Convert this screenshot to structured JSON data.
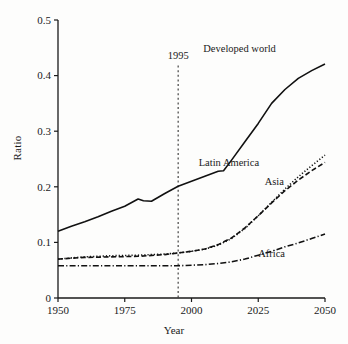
{
  "chart_data": {
    "type": "line",
    "title": "",
    "xlabel": "Year",
    "ylabel": "Ratio",
    "xlim": [
      1950,
      2050
    ],
    "ylim": [
      0,
      0.5
    ],
    "xticks": [
      1950,
      1975,
      2000,
      2025,
      2050
    ],
    "xticklabels": [
      "1950",
      "1975",
      "2000",
      "2025",
      "2050"
    ],
    "yticks": [
      0,
      0.1,
      0.2,
      0.3,
      0.4,
      0.5
    ],
    "yticklabels": [
      "0",
      "0.1",
      "0.2",
      "0.3",
      "0.4",
      "0.5"
    ],
    "grid": false,
    "legend_position": "inline-annotations",
    "annotations": [
      {
        "text": "1995",
        "type": "vertical-line",
        "x": 1995,
        "label_y": 0.43,
        "linestyle": "dotted"
      }
    ],
    "series": [
      {
        "name": "Developed world",
        "linestyle": "solid",
        "color": "#111111",
        "label_x": 2018,
        "label_y": 0.443,
        "x": [
          1950,
          1955,
          1960,
          1965,
          1970,
          1975,
          1980,
          1982,
          1985,
          1990,
          1995,
          2000,
          2005,
          2010,
          2012,
          2015,
          2020,
          2025,
          2030,
          2035,
          2040,
          2045,
          2050
        ],
        "y": [
          0.12,
          0.129,
          0.137,
          0.146,
          0.156,
          0.165,
          0.178,
          0.175,
          0.174,
          0.188,
          0.201,
          0.21,
          0.219,
          0.228,
          0.229,
          0.248,
          0.281,
          0.314,
          0.35,
          0.375,
          0.395,
          0.409,
          0.421
        ]
      },
      {
        "name": "Latin America",
        "linestyle": "dotted",
        "color": "#111111",
        "label_x": 2014,
        "label_y": 0.238,
        "x": [
          1950,
          1960,
          1970,
          1980,
          1990,
          1995,
          2000,
          2005,
          2010,
          2015,
          2020,
          2025,
          2030,
          2035,
          2040,
          2045,
          2050
        ],
        "y": [
          0.07,
          0.074,
          0.076,
          0.077,
          0.079,
          0.081,
          0.084,
          0.088,
          0.095,
          0.107,
          0.125,
          0.148,
          0.172,
          0.196,
          0.218,
          0.238,
          0.257
        ]
      },
      {
        "name": "Asia",
        "linestyle": "dashed",
        "color": "#111111",
        "label_x": 2031,
        "label_y": 0.204,
        "x": [
          1950,
          1960,
          1970,
          1980,
          1990,
          1995,
          2000,
          2005,
          2010,
          2015,
          2020,
          2025,
          2030,
          2035,
          2040,
          2045,
          2050
        ],
        "y": [
          0.07,
          0.073,
          0.074,
          0.075,
          0.078,
          0.081,
          0.084,
          0.088,
          0.096,
          0.108,
          0.126,
          0.148,
          0.171,
          0.193,
          0.212,
          0.229,
          0.244
        ]
      },
      {
        "name": "Africa",
        "linestyle": "dashdot",
        "color": "#111111",
        "label_x": 2030,
        "label_y": 0.073,
        "x": [
          1950,
          1960,
          1970,
          1980,
          1990,
          1995,
          2000,
          2005,
          2010,
          2015,
          2020,
          2025,
          2030,
          2035,
          2040,
          2045,
          2050
        ],
        "y": [
          0.058,
          0.058,
          0.058,
          0.058,
          0.058,
          0.058,
          0.059,
          0.06,
          0.062,
          0.065,
          0.07,
          0.077,
          0.084,
          0.092,
          0.099,
          0.107,
          0.115
        ]
      }
    ]
  }
}
